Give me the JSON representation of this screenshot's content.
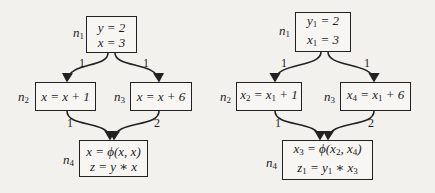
{
  "diagram": {
    "type": "control-flow-graph",
    "left": {
      "title": "original",
      "nodes": [
        {
          "id": "n1",
          "name": "n",
          "sub": "1",
          "lines": [
            "y = 2",
            "x = 3"
          ]
        },
        {
          "id": "n2",
          "name": "n",
          "sub": "2",
          "lines": [
            "x = x + 1"
          ]
        },
        {
          "id": "n3",
          "name": "n",
          "sub": "3",
          "lines": [
            "x = x + 6"
          ]
        },
        {
          "id": "n4",
          "name": "n",
          "sub": "4",
          "lines": [
            "x = ϕ(x, x)",
            "z = y ∗ x"
          ]
        }
      ],
      "edges": [
        {
          "from": "n1",
          "to": "n2",
          "label": "1"
        },
        {
          "from": "n1",
          "to": "n3",
          "label": "1"
        },
        {
          "from": "n2",
          "to": "n4",
          "label": "1"
        },
        {
          "from": "n3",
          "to": "n4",
          "label": "2"
        }
      ]
    },
    "right": {
      "title": "ssa",
      "nodes": [
        {
          "id": "n1",
          "name": "n",
          "sub": "1",
          "lines": [
            [
              "y",
              "1",
              " = 2"
            ],
            [
              "x",
              "1",
              " = 3"
            ]
          ]
        },
        {
          "id": "n2",
          "name": "n",
          "sub": "2",
          "lines": [
            [
              "x",
              "2",
              " = x",
              "1",
              " + 1"
            ]
          ]
        },
        {
          "id": "n3",
          "name": "n",
          "sub": "3",
          "lines": [
            [
              "x",
              "4",
              " = x",
              "1",
              " + 6"
            ]
          ]
        },
        {
          "id": "n4",
          "name": "n",
          "sub": "4",
          "lines": [
            [
              "x",
              "3",
              " = ϕ(x",
              "2",
              ", x",
              "4",
              ")"
            ],
            [
              "z",
              "1",
              " = y",
              "1",
              " ∗ x",
              "3",
              ""
            ]
          ]
        }
      ],
      "edges": [
        {
          "from": "n1",
          "to": "n2",
          "label": "1"
        },
        {
          "from": "n1",
          "to": "n3",
          "label": "1"
        },
        {
          "from": "n2",
          "to": "n4",
          "label": "1"
        },
        {
          "from": "n3",
          "to": "n4",
          "label": "2"
        }
      ]
    }
  }
}
